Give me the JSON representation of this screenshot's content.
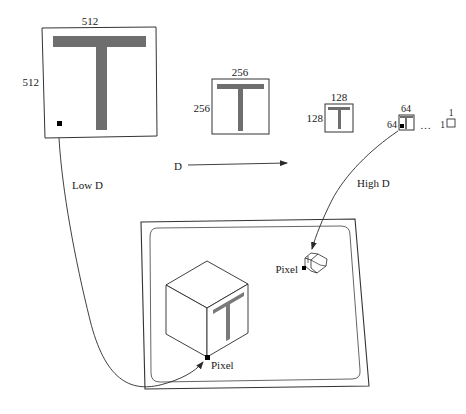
{
  "diagram": {
    "title": "",
    "mip_levels": [
      {
        "id": "level-512",
        "width_label": "512",
        "height_label": "512"
      },
      {
        "id": "level-256",
        "width_label": "256",
        "height_label": "256"
      },
      {
        "id": "level-128",
        "width_label": "128",
        "height_label": "128"
      },
      {
        "id": "level-64",
        "width_label": "64",
        "height_label": "64"
      },
      {
        "id": "level-1",
        "width_label": "1",
        "height_label": "1"
      }
    ],
    "ellipsis": "…",
    "axis": {
      "label": "D",
      "direction": "increasing to the right"
    },
    "arrows": {
      "low": {
        "label": "Low D"
      },
      "high": {
        "label": "High D"
      }
    },
    "screen": {
      "large_cube": {
        "pixel_label": "Pixel",
        "face_texture": "T"
      },
      "small_cube": {
        "pixel_label": "Pixel"
      }
    },
    "colors": {
      "texture_gray": "#6e6e6e",
      "line": "#2a2a2a",
      "pixel": "#000000",
      "background": "#ffffff"
    }
  }
}
